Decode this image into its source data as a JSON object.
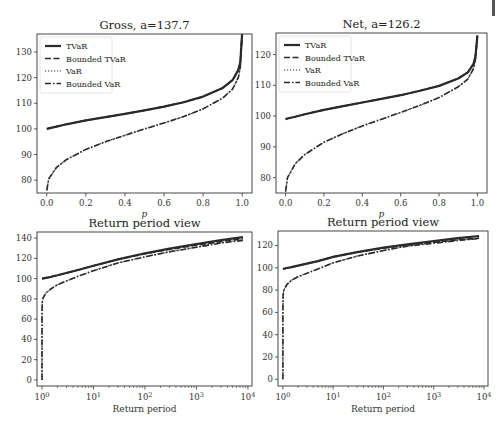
{
  "chart_data": [
    {
      "type": "line",
      "title": "Gross, a=137.7",
      "xlabel": "p",
      "ylabel": "",
      "xlim": [
        -0.05,
        1.05
      ],
      "ylim": [
        75,
        137
      ],
      "xticks": [
        "0.0",
        "0.2",
        "0.4",
        "0.6",
        "0.8",
        "1.0"
      ],
      "yticks": [
        "80",
        "90",
        "100",
        "110",
        "120",
        "130"
      ],
      "legend": [
        "TVaR",
        "Bounded TVaR",
        "VaR",
        "Bounded VaR"
      ],
      "legend_position": "upper left",
      "grid": false,
      "x": [
        0.0,
        0.01,
        0.05,
        0.1,
        0.2,
        0.3,
        0.4,
        0.5,
        0.6,
        0.7,
        0.8,
        0.9,
        0.95,
        0.98,
        0.99,
        1.0
      ],
      "series": [
        {
          "name": "TVaR",
          "values": [
            100.0,
            100.2,
            100.9,
            101.8,
            103.3,
            104.6,
            105.9,
            107.2,
            108.7,
            110.4,
            112.6,
            116.0,
            119.0,
            123.0,
            126.0,
            137.7
          ]
        },
        {
          "name": "Bounded TVaR",
          "values": [
            100.0,
            100.2,
            100.9,
            101.8,
            103.3,
            104.6,
            105.9,
            107.2,
            108.7,
            110.4,
            112.6,
            116.0,
            119.0,
            123.0,
            126.0,
            137.7
          ]
        },
        {
          "name": "VaR",
          "values": [
            76.0,
            80.5,
            85.0,
            88.0,
            92.0,
            95.0,
            97.5,
            100.0,
            102.3,
            104.8,
            107.8,
            112.0,
            115.5,
            120.0,
            124.0,
            137.7
          ]
        },
        {
          "name": "Bounded VaR",
          "values": [
            76.0,
            80.5,
            85.0,
            88.0,
            92.0,
            95.0,
            97.5,
            100.0,
            102.3,
            104.8,
            107.8,
            112.0,
            115.5,
            120.0,
            124.0,
            137.7
          ]
        }
      ]
    },
    {
      "type": "line",
      "title": "Net, a=126.2",
      "xlabel": "p",
      "ylabel": "",
      "xlim": [
        -0.05,
        1.05
      ],
      "ylim": [
        75,
        127
      ],
      "xticks": [
        "0.0",
        "0.2",
        "0.4",
        "0.6",
        "0.8",
        "1.0"
      ],
      "yticks": [
        "80",
        "90",
        "100",
        "110",
        "120"
      ],
      "legend": [
        "TVaR",
        "Bounded TVaR",
        "VaR",
        "Bounded VaR"
      ],
      "legend_position": "upper left",
      "grid": false,
      "x": [
        0.0,
        0.01,
        0.05,
        0.1,
        0.2,
        0.3,
        0.4,
        0.5,
        0.6,
        0.7,
        0.8,
        0.9,
        0.95,
        0.98,
        0.99,
        1.0
      ],
      "series": [
        {
          "name": "TVaR",
          "values": [
            99.0,
            99.2,
            99.8,
            100.6,
            102.0,
            103.2,
            104.4,
            105.6,
            106.8,
            108.2,
            109.8,
            112.2,
            114.2,
            117.0,
            119.5,
            126.2
          ]
        },
        {
          "name": "Bounded TVaR",
          "values": [
            99.0,
            99.2,
            99.8,
            100.6,
            102.0,
            103.2,
            104.4,
            105.6,
            106.8,
            108.2,
            109.8,
            112.2,
            114.2,
            117.0,
            119.5,
            126.2
          ]
        },
        {
          "name": "VaR",
          "values": [
            75.5,
            80.0,
            84.5,
            87.5,
            91.5,
            94.3,
            96.8,
            99.0,
            101.2,
            103.5,
            106.0,
            109.5,
            112.0,
            115.5,
            118.5,
            126.2
          ]
        },
        {
          "name": "Bounded VaR",
          "values": [
            75.5,
            80.0,
            84.5,
            87.5,
            91.5,
            94.3,
            96.8,
            99.0,
            101.2,
            103.5,
            106.0,
            109.5,
            112.0,
            115.5,
            118.5,
            126.2
          ]
        }
      ]
    },
    {
      "type": "line",
      "title": "Return period view",
      "xlabel": "Return period",
      "ylabel": "",
      "xscale": "log",
      "xlim": [
        0.8,
        12000
      ],
      "ylim": [
        -6,
        146
      ],
      "xticks": [
        "10^0",
        "10^1",
        "10^2",
        "10^3",
        "10^4"
      ],
      "yticks": [
        "0",
        "20",
        "40",
        "60",
        "80",
        "100",
        "120",
        "140"
      ],
      "grid": false,
      "x": [
        1,
        1.001,
        1.01,
        1.05,
        1.2,
        1.5,
        2,
        5,
        10,
        30,
        100,
        300,
        1000,
        3000,
        8000
      ],
      "series": [
        {
          "name": "TVaR",
          "values": [
            100.0,
            100.0,
            100.0,
            100.2,
            100.8,
            101.8,
            103.3,
            108.5,
            112.6,
            119.0,
            125.0,
            129.5,
            134.0,
            138.0,
            141.0
          ]
        },
        {
          "name": "Bounded TVaR",
          "values": [
            100.0,
            100.0,
            100.0,
            100.2,
            100.8,
            101.8,
            103.3,
            108.5,
            112.6,
            119.0,
            124.5,
            128.8,
            133.0,
            136.5,
            139.5
          ]
        },
        {
          "name": "VaR",
          "values": [
            0,
            60,
            76,
            81,
            86,
            90,
            94,
            102.3,
            107.8,
            115.5,
            121.5,
            126.5,
            131.0,
            135.5,
            138.5
          ]
        },
        {
          "name": "Bounded VaR",
          "values": [
            0,
            60,
            76,
            81,
            86,
            90,
            94,
            102.3,
            107.8,
            115.5,
            121.5,
            126.5,
            131.0,
            135.0,
            137.7
          ]
        }
      ]
    },
    {
      "type": "line",
      "title": "Return period view",
      "xlabel": "Return period",
      "ylabel": "",
      "xscale": "log",
      "xlim": [
        0.8,
        12000
      ],
      "ylim": [
        -6,
        133
      ],
      "xticks": [
        "10^0",
        "10^1",
        "10^2",
        "10^3",
        "10^4"
      ],
      "yticks": [
        "0",
        "20",
        "40",
        "60",
        "80",
        "100",
        "120"
      ],
      "grid": false,
      "x": [
        1,
        1.001,
        1.01,
        1.05,
        1.2,
        1.5,
        2,
        5,
        10,
        30,
        100,
        300,
        1000,
        3000,
        8000
      ],
      "series": [
        {
          "name": "TVaR",
          "values": [
            99.0,
            99.0,
            99.0,
            99.2,
            99.8,
            100.6,
            102.0,
            106.0,
            109.8,
            114.0,
            118.0,
            121.0,
            124.0,
            126.5,
            128.5
          ]
        },
        {
          "name": "Bounded TVaR",
          "values": [
            99.0,
            99.0,
            99.0,
            99.2,
            99.8,
            100.6,
            102.0,
            106.0,
            109.8,
            114.0,
            117.5,
            120.5,
            123.0,
            125.0,
            126.5
          ]
        },
        {
          "name": "VaR",
          "values": [
            0,
            60,
            75.5,
            80,
            85,
            89,
            92,
            99.0,
            104.5,
            110.5,
            115.5,
            119.5,
            122.5,
            125.0,
            127.0
          ]
        },
        {
          "name": "Bounded VaR",
          "values": [
            0,
            60,
            75.5,
            80,
            85,
            89,
            92,
            99.0,
            104.5,
            110.5,
            115.5,
            119.5,
            122.0,
            124.5,
            126.2
          ]
        }
      ]
    }
  ]
}
